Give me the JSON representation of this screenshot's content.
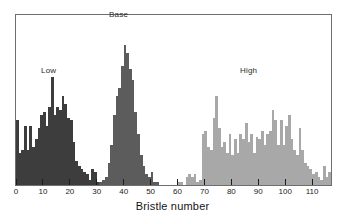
{
  "figure": {
    "xlabel": "Bristle number",
    "background": "#ffffff",
    "frame_color": "#6e6e6e"
  },
  "labels": {
    "low": "Low",
    "base": "Base",
    "high": "High"
  },
  "colors": {
    "low": "#3d3d3d",
    "base": "#5c5c5c",
    "high": "#a8a8a8",
    "axis": "#1c1c1c",
    "text": "#1c1c1c"
  },
  "chart_data": {
    "type": "bar",
    "title": "",
    "subtitle": "",
    "xlabel": "Bristle number",
    "ylabel": "",
    "xlim": [
      0,
      117
    ],
    "ylim": [
      0,
      62
    ],
    "grid": false,
    "legend": "inline-annotations",
    "bin_width": 1,
    "xticks": [
      0,
      10,
      20,
      30,
      40,
      50,
      60,
      70,
      80,
      90,
      100,
      110
    ],
    "xticklabels": [
      "0",
      "10",
      "20",
      "30",
      "40",
      "50",
      "60",
      "70",
      "80",
      "90",
      "100",
      "110"
    ],
    "annotations": [
      {
        "text": "Low",
        "x": 12,
        "y": 48
      },
      {
        "text": "Base",
        "x": 40,
        "y": 61
      },
      {
        "text": "High",
        "x": 90,
        "y": 48
      }
    ],
    "series": [
      {
        "name": "Low",
        "color": "#3d3d3d",
        "x": [
          0,
          1,
          2,
          3,
          4,
          5,
          6,
          7,
          8,
          9,
          10,
          11,
          12,
          13,
          14,
          15,
          16,
          17,
          18,
          19,
          20,
          21,
          22,
          23,
          24,
          25,
          26,
          27,
          28,
          29,
          30,
          31,
          32,
          33
        ],
        "values": [
          24,
          12,
          13,
          22,
          13,
          22,
          14,
          17,
          21,
          26,
          27,
          22,
          29,
          40,
          26,
          29,
          28,
          33,
          30,
          25,
          24,
          16,
          9,
          7,
          6,
          5,
          4,
          2,
          6,
          5,
          1,
          0,
          1,
          1
        ]
      },
      {
        "name": "Base",
        "color": "#5c5c5c",
        "x": [
          31,
          32,
          33,
          34,
          35,
          36,
          37,
          38,
          39,
          40,
          41,
          42,
          43,
          44,
          45,
          46,
          47,
          48,
          49,
          50,
          51,
          52
        ],
        "values": [
          1,
          2,
          3,
          8,
          15,
          26,
          33,
          36,
          44,
          52,
          49,
          43,
          39,
          27,
          19,
          11,
          7,
          4,
          3,
          5,
          1,
          1
        ]
      },
      {
        "name": "High",
        "color": "#a8a8a8",
        "x": [
          60,
          61,
          62,
          63,
          64,
          65,
          66,
          67,
          68,
          69,
          70,
          71,
          72,
          73,
          74,
          75,
          76,
          77,
          78,
          79,
          80,
          81,
          82,
          83,
          84,
          85,
          86,
          87,
          88,
          89,
          90,
          91,
          92,
          93,
          94,
          95,
          96,
          97,
          98,
          99,
          100,
          101,
          102,
          103,
          104,
          105,
          106,
          107,
          108,
          109,
          110,
          111,
          112,
          113,
          114,
          115,
          116
        ],
        "values": [
          1,
          1,
          0,
          3,
          4,
          3,
          4,
          1,
          2,
          19,
          20,
          14,
          13,
          25,
          33,
          21,
          14,
          16,
          12,
          19,
          11,
          17,
          12,
          19,
          17,
          23,
          16,
          19,
          12,
          18,
          17,
          20,
          15,
          19,
          20,
          28,
          24,
          15,
          24,
          15,
          22,
          26,
          17,
          13,
          11,
          21,
          13,
          8,
          7,
          6,
          4,
          5,
          3,
          2,
          7,
          3,
          5
        ]
      }
    ]
  }
}
